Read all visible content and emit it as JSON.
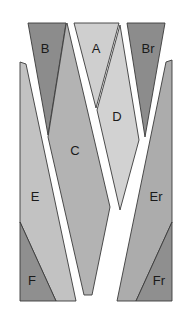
{
  "diagram": {
    "pieces": [
      {
        "id": "B",
        "label": "B",
        "shade": "dark",
        "color": "#8c8c8c",
        "points": "28,23 66,23 48,135",
        "label_pos": [
          45,
          50
        ]
      },
      {
        "id": "A",
        "label": "A",
        "shade": "light",
        "color": "#cfcfcf",
        "points": "74,23 119,23 96,108",
        "label_pos": [
          96,
          50
        ]
      },
      {
        "id": "Br",
        "label": "Br",
        "shade": "dark",
        "color": "#8c8c8c",
        "points": "127,23 165,23 145,137",
        "label_pos": [
          148,
          50
        ]
      },
      {
        "id": "D",
        "label": "D",
        "shade": "light",
        "color": "#d2d2d2",
        "points": "120,25 139,140 120,210 97,110",
        "label_pos": [
          117,
          118
        ]
      },
      {
        "id": "C",
        "label": "C",
        "shade": "medium",
        "color": "#b3b3b3",
        "points": "67,23 110,207 92,295 84,295 48,137 66,25",
        "label_pos": [
          75,
          152
        ]
      },
      {
        "id": "E",
        "label": "E",
        "shade": "medium",
        "color": "#c2c2c2",
        "points": "20,62 26,64 76,301 56,301 20,222",
        "label_pos": [
          35,
          198
        ]
      },
      {
        "id": "F",
        "label": "F",
        "shade": "dark",
        "color": "#8f8f8f",
        "points": "20,222 56,301 20,301",
        "label_pos": [
          32,
          282
        ]
      },
      {
        "id": "Er",
        "label": "Er",
        "shade": "medium",
        "color": "#acacac",
        "points": "166,62 172,60 172,222 136,301 117,301",
        "label_pos": [
          156,
          198
        ]
      },
      {
        "id": "Fr",
        "label": "Fr",
        "shade": "dark",
        "color": "#8f8f8f",
        "points": "172,222 172,301 136,301",
        "label_pos": [
          159,
          282
        ]
      }
    ]
  }
}
